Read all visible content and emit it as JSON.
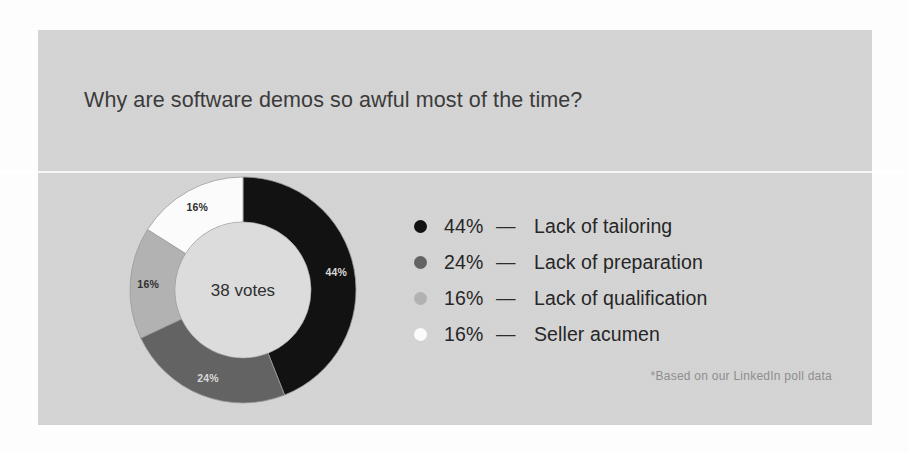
{
  "card": {
    "title": "Why are software demos so awful most of the time?",
    "footnote": "*Based on our LinkedIn poll data",
    "background_color": "#d5d5d5"
  },
  "chart_data": {
    "type": "pie",
    "variant": "donut",
    "title": "Why are software demos so awful most of the time?",
    "center_label": "38 votes",
    "total_votes": 38,
    "unit": "%",
    "legend_position": "right",
    "grid": false,
    "categories": [
      "Lack of tailoring",
      "Lack of preparation",
      "Lack of qualification",
      "Seller acumen"
    ],
    "values": [
      44,
      24,
      16,
      16
    ],
    "slice_labels": [
      "44%",
      "24%",
      "16%",
      "16%"
    ],
    "colors": [
      "#121212",
      "#636363",
      "#b2b2b2",
      "#fbfbfb"
    ],
    "slice_label_colors": [
      "#d8d8d8",
      "#d8d8d8",
      "#2f2f2f",
      "#2f2f2f"
    ],
    "annotations": [
      "*Based on our LinkedIn poll data"
    ]
  },
  "legend": {
    "rows": [
      {
        "bullet": "bullet-dot-black",
        "pct": "44%",
        "dash": "—",
        "label": "Lack of tailoring",
        "color": "#121212"
      },
      {
        "bullet": "bullet-dot-dark-gray",
        "pct": "24%",
        "dash": "—",
        "label": "Lack of preparation",
        "color": "#636363"
      },
      {
        "bullet": "bullet-dot-light-gray",
        "pct": "16%",
        "dash": "—",
        "label": "Lack of qualification",
        "color": "#b2b2b2"
      },
      {
        "bullet": "bullet-dot-white",
        "pct": "16%",
        "dash": "—",
        "label": "Seller acumen",
        "color": "#fbfbfb"
      }
    ]
  }
}
